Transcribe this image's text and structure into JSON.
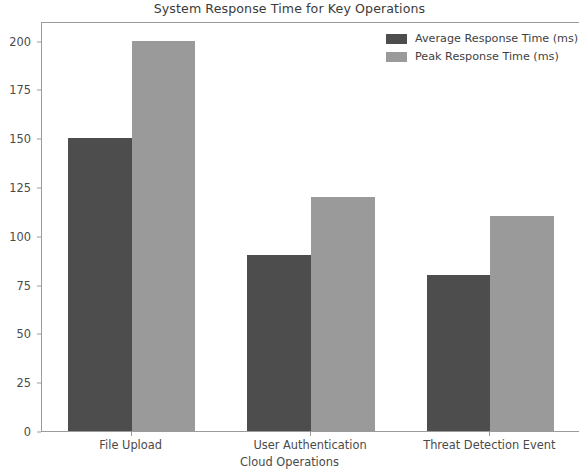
{
  "chart_data": {
    "type": "bar",
    "title": "System Response Time for Key Operations",
    "xlabel": "Cloud Operations",
    "ylabel": "",
    "categories": [
      "File Upload",
      "User Authentication",
      "Threat Detection Event"
    ],
    "series": [
      {
        "name": "Average Response Time (ms)",
        "values": [
          150,
          90,
          80
        ],
        "color": "#4d4d4d"
      },
      {
        "name": "Peak Response Time (ms)",
        "values": [
          200,
          120,
          110
        ],
        "color": "#9a9a9a"
      }
    ],
    "ylim": [
      0,
      210
    ],
    "yticks": [
      0,
      25,
      50,
      75,
      100,
      125,
      150,
      175,
      200
    ],
    "ytick_labels": [
      "0",
      "25",
      "50",
      "75",
      "100",
      "125",
      "150",
      "175",
      "200"
    ],
    "grid": false,
    "legend_position": "upper right",
    "background_color": "#ffffff"
  }
}
